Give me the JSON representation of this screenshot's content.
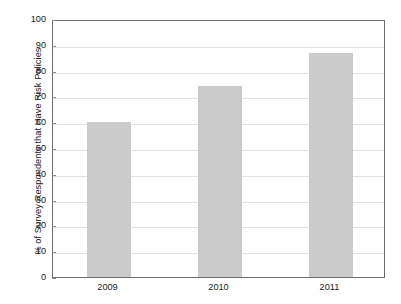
{
  "chart_data": {
    "type": "bar",
    "title": "",
    "subtitle": "",
    "xlabel": "",
    "ylabel": "% of Survey Respondents that Have Risk Policies",
    "categories": [
      "2009",
      "2010",
      "2011"
    ],
    "values": [
      60,
      74,
      87
    ],
    "series": [
      {
        "name": "% of Survey Respondents that Have Risk Policies",
        "values": [
          60,
          74,
          87
        ]
      }
    ],
    "ylim": [
      0,
      100
    ],
    "y_ticks": [
      0,
      10,
      20,
      30,
      40,
      50,
      60,
      70,
      80,
      90,
      100
    ],
    "y_tick_labels": [
      "0",
      "10",
      "20",
      "30",
      "40",
      "50",
      "60",
      "70",
      "80",
      "90",
      "100"
    ],
    "grid": true,
    "grid_axis": "y",
    "legend": false,
    "legend_position": "none",
    "bar_color": "#cbcbcb",
    "grid_color": "#e3e3e3",
    "frame_color": "#6e6e6e",
    "text_color": "#1a1a1a",
    "background_color": "#ffffff",
    "annotations": []
  }
}
